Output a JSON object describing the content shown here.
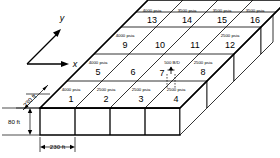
{
  "diagram": {
    "axes": {
      "x_label": "x",
      "y_label": "y"
    },
    "dimensions": {
      "width_label": "230 ft",
      "depth_label": "230 ft",
      "thickness_label": "80 ft"
    },
    "well": {
      "rate_label": "500 B/D",
      "cell": "7",
      "icon": "well-derrick-icon"
    },
    "grid": {
      "rows": 4,
      "cols": 4,
      "cells": [
        {
          "number": "1",
          "pressure": "4000 psia"
        },
        {
          "number": "2",
          "pressure": "2500 psia"
        },
        {
          "number": "3",
          "pressure": "2500 psia"
        },
        {
          "number": "4",
          "pressure": "2500 psia"
        },
        {
          "number": "5",
          "pressure": "4000 psia"
        },
        {
          "number": "6",
          "pressure": ""
        },
        {
          "number": "7",
          "pressure": ""
        },
        {
          "number": "8",
          "pressure": "2500 psia"
        },
        {
          "number": "9",
          "pressure": "4000 psia"
        },
        {
          "number": "10",
          "pressure": ""
        },
        {
          "number": "11",
          "pressure": ""
        },
        {
          "number": "12",
          "pressure": "2500 psia"
        },
        {
          "number": "13",
          "pressure": "4000 psia"
        },
        {
          "number": "14",
          "pressure": "3500 psia"
        },
        {
          "number": "15",
          "pressure": "3500 psia"
        },
        {
          "number": "16",
          "pressure": "3500 psia"
        }
      ]
    },
    "colors": {
      "line": "#000000",
      "face": "#ffffff",
      "background": "#ffffff"
    }
  }
}
